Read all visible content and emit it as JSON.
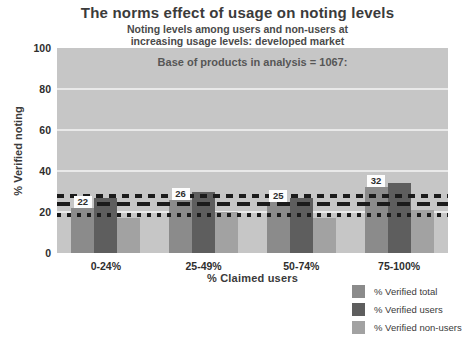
{
  "title": "The norms effect of usage on noting levels",
  "subtitle": [
    "Noting levels among users and non-users at",
    "increasing usage levels: developed market"
  ],
  "annotation": "Base of products in analysis = 1067:",
  "chart_data": {
    "type": "bar",
    "title": "The norms effect of usage on noting levels",
    "categories": [
      "0-24%",
      "25-49%",
      "50-74%",
      "75-100%"
    ],
    "series": [
      {
        "name": "% Verified total",
        "values": [
          22,
          26,
          25,
          32
        ],
        "color": "#8b8b8b"
      },
      {
        "name": "% Verified users",
        "values": [
          27,
          30,
          27,
          34
        ],
        "color": "#5e5e5e"
      },
      {
        "name": "% Verified non-users",
        "values": [
          17,
          20,
          17,
          21
        ],
        "color": "#a2a2a2"
      }
    ],
    "bar_value_labels": {
      "on_series": "% Verified total",
      "values": [
        "22",
        "26",
        "25",
        "32"
      ]
    },
    "reference_lines": [
      {
        "value": 28,
        "line_style": "short-dash",
        "color": "#1b1b1b"
      },
      {
        "value": 24,
        "line_style": "long-dash",
        "color": "#1b1b1b"
      },
      {
        "value": 18.5,
        "line_style": "dotted",
        "color": "#1b1b1b"
      }
    ],
    "xlabel": "% Claimed users",
    "ylabel": "% Verified noting",
    "ylim": [
      0,
      100
    ],
    "yticks": [
      0,
      20,
      40,
      60,
      80,
      100
    ],
    "grid": true,
    "plot_background": "#c6c6c6",
    "legend_position": "bottom-right"
  }
}
